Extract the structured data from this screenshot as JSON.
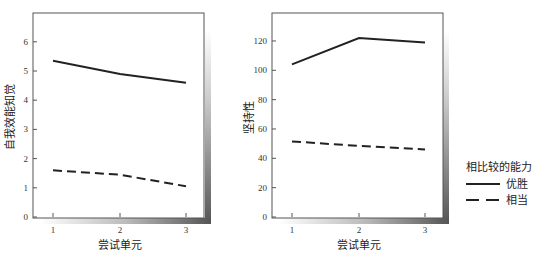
{
  "chart_data": [
    {
      "type": "line",
      "title": "",
      "xlabel": "尝试单元",
      "ylabel": "自我效能知觉",
      "categories": [
        "1",
        "2",
        "3"
      ],
      "yticks": [
        "0",
        "1",
        "2",
        "3",
        "4",
        "5",
        "6"
      ],
      "ylim": [
        0,
        7
      ],
      "grid": false,
      "series": [
        {
          "name": "优胜",
          "style": "solid",
          "values": [
            5.35,
            4.9,
            4.6
          ]
        },
        {
          "name": "相当",
          "style": "dashed",
          "values": [
            1.6,
            1.45,
            1.05
          ]
        }
      ]
    },
    {
      "type": "line",
      "title": "",
      "xlabel": "尝试单元",
      "ylabel": "坚持性",
      "categories": [
        "1",
        "2",
        "3"
      ],
      "yticks": [
        "0",
        "20",
        "40",
        "60",
        "80",
        "100",
        "120"
      ],
      "ylim": [
        0,
        140
      ],
      "grid": false,
      "series": [
        {
          "name": "优胜",
          "style": "solid",
          "values": [
            104,
            122,
            119
          ]
        },
        {
          "name": "相当",
          "style": "dashed",
          "values": [
            51.5,
            48.5,
            46
          ]
        }
      ]
    }
  ],
  "legend": {
    "title": "相比较的能力",
    "items": [
      {
        "label": "优胜",
        "style": "solid"
      },
      {
        "label": "相当",
        "style": "dashed"
      }
    ],
    "position": "right"
  }
}
